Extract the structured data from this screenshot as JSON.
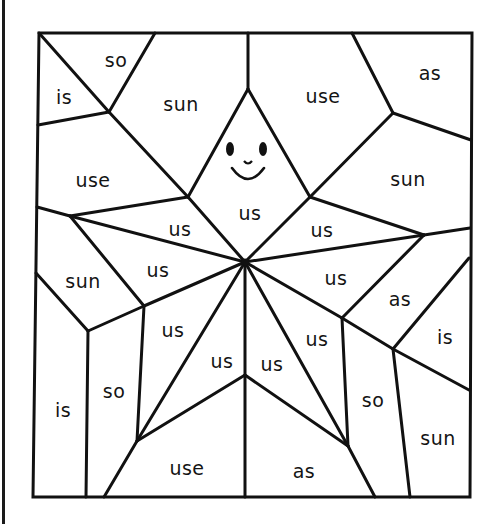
{
  "worksheet": {
    "title": "Color-by-word star puzzle",
    "line_color": "#111111",
    "background": "#ffffff",
    "face": {
      "eyes": 2,
      "nose": "small curve",
      "mouth": "smile"
    },
    "regions": [
      {
        "id": "r1",
        "word": "so",
        "x": 116,
        "y": 60
      },
      {
        "id": "r2",
        "word": "is",
        "x": 64,
        "y": 97
      },
      {
        "id": "r3",
        "word": "sun",
        "x": 181,
        "y": 104
      },
      {
        "id": "r4",
        "word": "use",
        "x": 323,
        "y": 96
      },
      {
        "id": "r5",
        "word": "as",
        "x": 430,
        "y": 73
      },
      {
        "id": "r6",
        "word": "use",
        "x": 93,
        "y": 180
      },
      {
        "id": "r7",
        "word": "sun",
        "x": 408,
        "y": 179
      },
      {
        "id": "r8",
        "word": "us",
        "x": 250,
        "y": 213
      },
      {
        "id": "r9",
        "word": "us",
        "x": 180,
        "y": 229
      },
      {
        "id": "r10",
        "word": "us",
        "x": 322,
        "y": 230
      },
      {
        "id": "r11",
        "word": "sun",
        "x": 83,
        "y": 281
      },
      {
        "id": "r12",
        "word": "us",
        "x": 158,
        "y": 270
      },
      {
        "id": "r13",
        "word": "us",
        "x": 336,
        "y": 278
      },
      {
        "id": "r14",
        "word": "as",
        "x": 400,
        "y": 299
      },
      {
        "id": "r15",
        "word": "is",
        "x": 445,
        "y": 337
      },
      {
        "id": "r16",
        "word": "us",
        "x": 173,
        "y": 330
      },
      {
        "id": "r17",
        "word": "us",
        "x": 222,
        "y": 361
      },
      {
        "id": "r18",
        "word": "us",
        "x": 272,
        "y": 364
      },
      {
        "id": "r19",
        "word": "us",
        "x": 317,
        "y": 339
      },
      {
        "id": "r20",
        "word": "so",
        "x": 114,
        "y": 391
      },
      {
        "id": "r21",
        "word": "is",
        "x": 63,
        "y": 410
      },
      {
        "id": "r22",
        "word": "so",
        "x": 373,
        "y": 400
      },
      {
        "id": "r23",
        "word": "sun",
        "x": 438,
        "y": 438
      },
      {
        "id": "r24",
        "word": "use",
        "x": 187,
        "y": 468
      },
      {
        "id": "r25",
        "word": "as",
        "x": 304,
        "y": 471
      }
    ]
  }
}
